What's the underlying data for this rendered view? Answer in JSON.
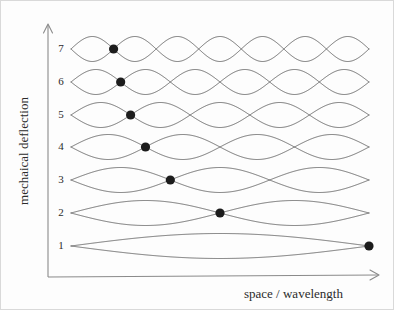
{
  "figure": {
    "background_color": "#fdfdfd",
    "border_color": "#d9d9d9",
    "curve_color": "#5a5a5a",
    "axis_color": "#8a8a8a",
    "marker_color": "#1c1c1c"
  },
  "axes": {
    "y_title": "mechaical deflection",
    "x_title": "space / wavelength",
    "y_tick_labels": [
      "1",
      "2",
      "3",
      "4",
      "5",
      "6",
      "7"
    ],
    "x_tick_labels": []
  },
  "chart_data": {
    "type": "line",
    "title": "",
    "xlabel": "space / wavelength",
    "ylabel": "mechaical deflection",
    "xlim": [
      0,
      1
    ],
    "ylim": [
      0.5,
      7.8
    ],
    "grid": false,
    "legend": "none",
    "categories": [
      "1",
      "2",
      "3",
      "4",
      "5",
      "6",
      "7"
    ],
    "series": [
      {
        "name": "mode 1",
        "mode_number": 1,
        "baseline": 1,
        "half_wavelengths": 1,
        "antinodes": 1,
        "amplitude": 0.38,
        "marker_x": 1.0,
        "marker_y": 1
      },
      {
        "name": "mode 2",
        "mode_number": 2,
        "baseline": 2,
        "half_wavelengths": 2,
        "antinodes": 2,
        "amplitude": 0.38,
        "marker_x": 0.5,
        "marker_y": 2
      },
      {
        "name": "mode 3",
        "mode_number": 3,
        "baseline": 3,
        "half_wavelengths": 3,
        "antinodes": 3,
        "amplitude": 0.38,
        "marker_x": 0.3333,
        "marker_y": 3
      },
      {
        "name": "mode 4",
        "mode_number": 4,
        "baseline": 4,
        "half_wavelengths": 4,
        "antinodes": 4,
        "amplitude": 0.38,
        "marker_x": 0.25,
        "marker_y": 4
      },
      {
        "name": "mode 5",
        "mode_number": 5,
        "baseline": 5,
        "half_wavelengths": 5,
        "antinodes": 5,
        "amplitude": 0.38,
        "marker_x": 0.2,
        "marker_y": 5
      },
      {
        "name": "mode 6",
        "mode_number": 6,
        "baseline": 6,
        "half_wavelengths": 6,
        "antinodes": 6,
        "amplitude": 0.38,
        "marker_x": 0.1667,
        "marker_y": 6
      },
      {
        "name": "mode 7",
        "mode_number": 7,
        "baseline": 7,
        "half_wavelengths": 7,
        "antinodes": 7,
        "amplitude": 0.38,
        "marker_x": 0.1429,
        "marker_y": 7
      }
    ]
  },
  "geometry": {
    "y_axis_x": 47,
    "y_axis_top": 24,
    "y_axis_bottom": 276,
    "x_axis_left": 47,
    "x_axis_right": 378,
    "x_axis_y": 276,
    "plot_left": 70,
    "plot_right": 368,
    "row_y": [
      245,
      212,
      179,
      146,
      114,
      81,
      48
    ],
    "row_amplitude_px": 12.5,
    "marker_radius_px": 4.6,
    "tick_label_x": 60,
    "y_title_x": 27,
    "y_title_y": 150,
    "x_title_x": 243,
    "x_title_y": 296
  }
}
